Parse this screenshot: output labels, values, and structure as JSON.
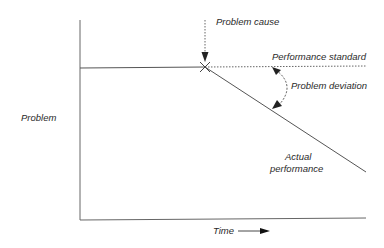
{
  "diagram": {
    "type": "performance-deviation-graph",
    "y_axis_label": "Problem",
    "x_axis_label": "Time",
    "labels": {
      "problem_cause": "Problem cause",
      "performance_standard": "Performance standard",
      "problem_deviation": "Problem deviation",
      "actual_performance_line1": "Actual",
      "actual_performance_line2": "performance"
    },
    "colors": {
      "line": "#555555",
      "text": "#2a2a2a",
      "background": "#ffffff"
    }
  }
}
